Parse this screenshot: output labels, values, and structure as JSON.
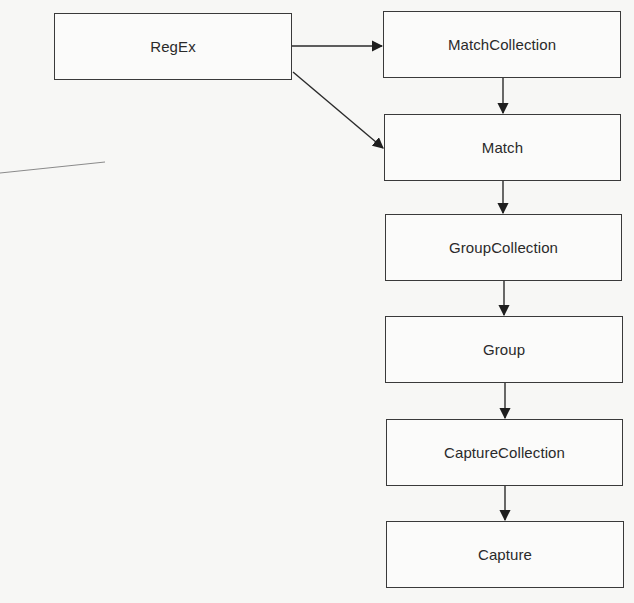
{
  "diagram": {
    "type": "class-hierarchy",
    "nodes": [
      {
        "id": "regex",
        "label": "RegEx",
        "x": 54,
        "y": 13,
        "w": 238,
        "h": 67
      },
      {
        "id": "matchcollection",
        "label": "MatchCollection",
        "x": 383,
        "y": 11,
        "w": 238,
        "h": 67
      },
      {
        "id": "match",
        "label": "Match",
        "x": 384,
        "y": 114,
        "w": 237,
        "h": 67
      },
      {
        "id": "groupcollection",
        "label": "GroupCollection",
        "x": 385,
        "y": 214,
        "w": 237,
        "h": 67
      },
      {
        "id": "group",
        "label": "Group",
        "x": 385,
        "y": 316,
        "w": 238,
        "h": 67
      },
      {
        "id": "capturecollection",
        "label": "CaptureCollection",
        "x": 386,
        "y": 419,
        "w": 237,
        "h": 67
      },
      {
        "id": "capture",
        "label": "Capture",
        "x": 386,
        "y": 521,
        "w": 238,
        "h": 67
      }
    ],
    "edges": [
      {
        "from": "regex",
        "to": "matchcollection"
      },
      {
        "from": "regex",
        "to": "match"
      },
      {
        "from": "matchcollection",
        "to": "match"
      },
      {
        "from": "match",
        "to": "groupcollection"
      },
      {
        "from": "groupcollection",
        "to": "group"
      },
      {
        "from": "group",
        "to": "capturecollection"
      },
      {
        "from": "capturecollection",
        "to": "capture"
      }
    ],
    "colors": {
      "background": "#f7f7f5",
      "stroke": "#3a3a3a",
      "text": "#2a2a2a",
      "stray_line": "#8a8a8a"
    }
  }
}
